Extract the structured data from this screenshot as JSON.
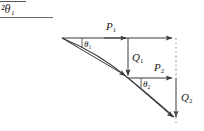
{
  "figure": {
    "title_fragment": {
      "text": "²θ₁",
      "has_rule_above": true,
      "has_rule_below": true
    },
    "labels": {
      "p1": "P",
      "p1_sub": "1",
      "q1": "Q",
      "q1_sub": "1",
      "p2": "P",
      "p2_sub": "2",
      "q2": "Q",
      "q2_sub": "2",
      "theta1": "θ",
      "theta1_sub": "1",
      "theta2": "θ",
      "theta2_sub": "2"
    },
    "colors": {
      "stroke": "#3a3a3a",
      "dashed": "#9a9a9a",
      "text": "#1a1a1a",
      "background": "#ffffff"
    },
    "geometry": {
      "vertex1": [
        62,
        38
      ],
      "vertex2": [
        128,
        78
      ],
      "end_point": [
        176,
        120
      ],
      "p1_arrow_from": [
        62,
        38
      ],
      "p1_arrow_to": [
        176,
        38
      ],
      "q1_arrow_from": [
        128,
        38
      ],
      "q1_arrow_to": [
        128,
        78
      ],
      "p2_arrow_from": [
        128,
        78
      ],
      "p2_arrow_to": [
        176,
        78
      ],
      "q2_arrow_from": [
        176,
        78
      ],
      "q2_arrow_to": [
        176,
        120
      ],
      "mid_arrow_to": [
        128,
        38
      ],
      "dashed_line_from": [
        176,
        38
      ],
      "dashed_line_to": [
        176,
        123
      ]
    }
  }
}
